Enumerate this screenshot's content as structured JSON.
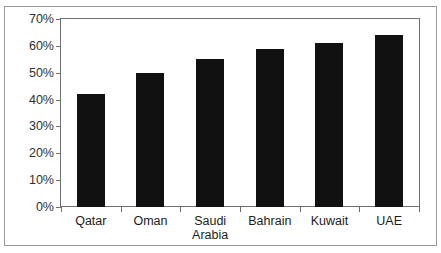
{
  "figure": {
    "title_cropped": "",
    "background_color": "#ffffff",
    "frame_color": "#9a9a9a"
  },
  "chart_data": {
    "type": "bar",
    "title": "",
    "xlabel": "",
    "ylabel": "",
    "categories": [
      "Qatar",
      "Oman",
      "Saudi\nArabia",
      "Bahrain",
      "Kuwait",
      "UAE"
    ],
    "values": [
      42,
      50,
      55,
      59,
      61,
      64
    ],
    "value_labels": [
      "42%",
      "50%",
      "55%",
      "59%",
      "61%",
      "64%"
    ],
    "ylim": [
      0,
      70
    ],
    "ytick_values": [
      70,
      60,
      50,
      40,
      30,
      20,
      10,
      0
    ],
    "ytick_labels": [
      "70%",
      "60%",
      "50%",
      "40%",
      "30%",
      "20%",
      "10%",
      "0%"
    ],
    "grid": false,
    "legend": false,
    "bar_color": "#111111",
    "axis_color": "#6f6f6f",
    "orientation": "vertical"
  }
}
